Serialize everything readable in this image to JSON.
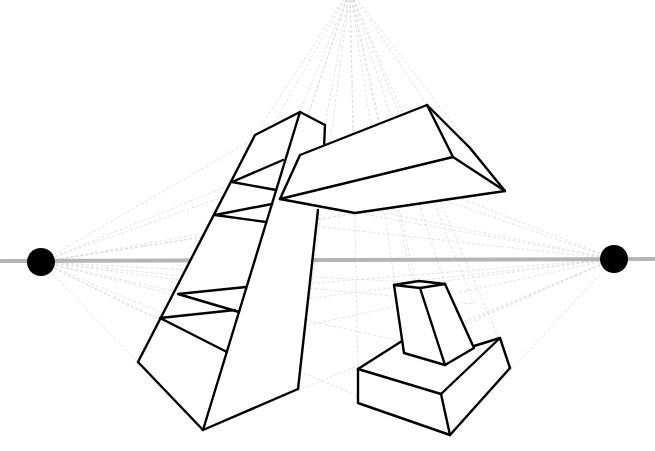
{
  "diagram": {
    "colors": {
      "background": "#ffffff",
      "outline": "#000000",
      "horizon": "#b5b5b5",
      "guides": "#d6d6d6",
      "vanishing_points": "#000000"
    },
    "horizon_y": 260,
    "vanishing_points": [
      {
        "name": "left",
        "x": 41,
        "y": 262
      },
      {
        "name": "right",
        "x": 614,
        "y": 259
      },
      {
        "name": "top",
        "x": 350,
        "y": -10
      }
    ],
    "objects": [
      {
        "name": "tall-shelf",
        "shelves": 2
      },
      {
        "name": "floating-box"
      },
      {
        "name": "pedestal-block"
      }
    ]
  }
}
